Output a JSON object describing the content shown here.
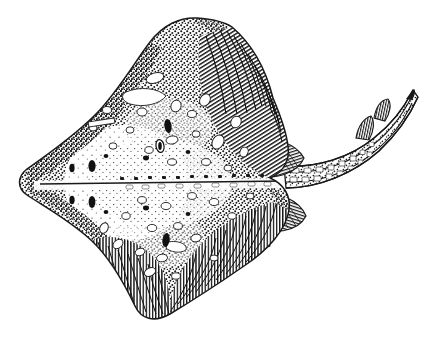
{
  "figure": {
    "domain": "natural-image",
    "subject_name": "skate-dorsal-view",
    "caption": "",
    "background_color": "#ffffff",
    "ink_color": "#1a1a1a",
    "technique": "pen-and-ink stipple and hatch line drawing",
    "width": 434,
    "height": 347
  },
  "anatomy": {
    "disc": {
      "label": "pectoral disc",
      "outline": "M 232,27 C 258,50 272,86 276,118 C 282,132 288,146 288,158 C 288,170 280,178 268,182 C 280,188 288,198 288,210 C 286,228 270,246 248,262 C 222,282 190,300 168,312 C 152,320 140,318 134,306 C 124,284 110,258 92,242 C 70,222 44,208 26,196 C 16,189 16,178 26,170 C 46,156 72,138 94,116 C 116,94 134,64 150,42 C 162,26 178,18 196,18 C 210,18 222,20 232,27 Z",
      "midline_y": 182
    },
    "snout": {
      "label": "rostrum",
      "tip_x": 232,
      "tip_y": 27
    },
    "wing_tip_left": {
      "label": "left pectoral tip",
      "x": 20,
      "y": 182
    },
    "wing_tip_top": {
      "label": "anterior disc margin",
      "x": 196,
      "y": 20
    },
    "wing_tip_bottom": {
      "label": "posterior disc margin",
      "x": 170,
      "y": 316
    },
    "pelvic_fins": {
      "label": "pelvic fins",
      "count": 2,
      "upper": "M 258,146 C 278,142 296,148 302,160 C 296,172 278,178 260,174 Z",
      "lower": "M 256,196 C 278,194 300,202 304,216 C 296,230 272,234 254,226 Z"
    },
    "tail": {
      "label": "caudal tail",
      "path": "M 292,176 C 320,176 352,166 376,146 C 394,131 404,112 410,96",
      "tip_x": 412,
      "tip_y": 92,
      "thorn_rows": 2,
      "banded": true
    },
    "dorsal_fins": {
      "label": "dorsal fins on tail",
      "count": 2,
      "positions": [
        [
          374,
          128
        ],
        [
          390,
          110
        ]
      ]
    },
    "ocelli": {
      "label": "dark ocellus spots",
      "count": 6,
      "points": [
        [
          90,
          166
        ],
        [
          90,
          200
        ],
        [
          126,
          162
        ],
        [
          126,
          204
        ],
        [
          168,
          120
        ],
        [
          166,
          244
        ]
      ]
    }
  },
  "markings": {
    "white_blotch_count": 34,
    "dark_spot_count": 12,
    "stipple_density": "dense",
    "hatch_regions": [
      "anterior-right margin",
      "posterior margin",
      "pelvic fins",
      "tail dorsal fins"
    ]
  },
  "accessibility": {
    "alt_text": "Black and white stippled line drawing of a skate seen from above, showing a diamond-shaped pectoral disc covered in dots and pale blotches, paired pelvic fins, and a long slender tail curving upward to the right with two rows of thorns and two small dorsal fins near the tip."
  }
}
